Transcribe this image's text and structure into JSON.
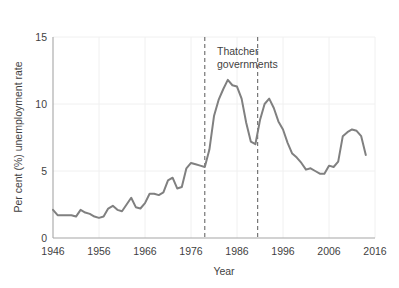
{
  "chart_data": {
    "type": "line",
    "title": "",
    "xlabel": "Year",
    "ylabel": "Per cent (%) unemployment rate",
    "xlim": [
      1946,
      2016
    ],
    "ylim": [
      0,
      15
    ],
    "xticks": [
      1946,
      1956,
      1966,
      1976,
      1986,
      1996,
      2006,
      2016
    ],
    "yticks": [
      0,
      5,
      10,
      15
    ],
    "grid": true,
    "legend": "none",
    "line_color": "#808080",
    "annotations": [
      {
        "name": "thatcher-governments",
        "text_line1": "Thatcher",
        "text_line2": "governments",
        "span_start_year": 1979,
        "span_end_year": 1990.5,
        "marker_style": "dashed-vertical-lines",
        "marker_color": "#595959"
      }
    ],
    "x": [
      1946,
      1947,
      1948,
      1949,
      1950,
      1951,
      1952,
      1953,
      1954,
      1955,
      1956,
      1957,
      1958,
      1959,
      1960,
      1961,
      1962,
      1963,
      1964,
      1965,
      1966,
      1967,
      1968,
      1969,
      1970,
      1971,
      1972,
      1973,
      1974,
      1975,
      1976,
      1977,
      1978,
      1979,
      1980,
      1981,
      1982,
      1983,
      1984,
      1985,
      1986,
      1987,
      1988,
      1989,
      1990,
      1991,
      1992,
      1993,
      1994,
      1995,
      1996,
      1997,
      1998,
      1999,
      2000,
      2001,
      2002,
      2003,
      2004,
      2005,
      2006,
      2007,
      2008,
      2009,
      2010,
      2011,
      2012,
      2013,
      2014
    ],
    "series": [
      {
        "name": "UK unemployment rate",
        "values": [
          2.1,
          1.7,
          1.7,
          1.7,
          1.7,
          1.6,
          2.1,
          1.9,
          1.8,
          1.6,
          1.5,
          1.6,
          2.2,
          2.4,
          2.1,
          2.0,
          2.5,
          3.0,
          2.3,
          2.2,
          2.6,
          3.3,
          3.3,
          3.2,
          3.4,
          4.3,
          4.5,
          3.7,
          3.8,
          5.2,
          5.6,
          5.5,
          5.4,
          5.3,
          6.6,
          9.1,
          10.3,
          11.1,
          11.8,
          11.4,
          11.3,
          10.4,
          8.6,
          7.2,
          7.0,
          8.8,
          10.0,
          10.4,
          9.7,
          8.7,
          8.1,
          7.1,
          6.3,
          6.0,
          5.6,
          5.1,
          5.2,
          5.0,
          4.8,
          4.8,
          5.4,
          5.3,
          5.7,
          7.6,
          7.9,
          8.1,
          8.0,
          7.6,
          6.2
        ]
      }
    ]
  },
  "axes": {
    "y_tick_labels": [
      "15",
      "10",
      "5",
      "0"
    ],
    "x_tick_labels": [
      "1946",
      "1956",
      "1966",
      "1976",
      "1986",
      "1996",
      "2006",
      "2016"
    ],
    "y_axis_title": "Per cent (%) unemployment rate",
    "x_axis_title": "Year"
  },
  "annotation": {
    "line1": "Thatcher",
    "line2": "governments"
  }
}
